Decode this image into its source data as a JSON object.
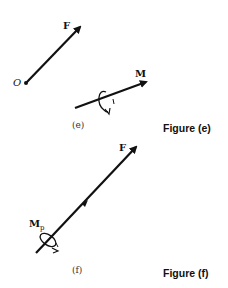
{
  "figure_e": {
    "force_label": "F",
    "origin_label": "O",
    "moment_label": "M",
    "subcaption": "(e)",
    "caption": "Figure (e)"
  },
  "figure_f": {
    "force_label": "F",
    "moment_label_main": "M",
    "moment_label_sub": "p",
    "subcaption": "(f)",
    "caption": "Figure (f)"
  },
  "colors": {
    "ink": "#111111",
    "background": "#ffffff"
  }
}
